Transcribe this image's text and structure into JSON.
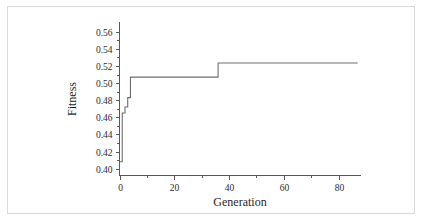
{
  "figure": {
    "background_color": "#ffffff",
    "border_color": "#d9d9d9",
    "axis_color": "#59595b",
    "line_color": "#6e6e70"
  },
  "chart_data": {
    "type": "line",
    "title": "",
    "xlabel": "Generation",
    "ylabel": "Fitness",
    "xlim": [
      0,
      88
    ],
    "ylim": [
      0.392,
      0.572
    ],
    "grid": false,
    "legend": null,
    "x_ticks": [
      0,
      20,
      40,
      60,
      80
    ],
    "x_tick_labels": [
      "0",
      "20",
      "40",
      "60",
      "80"
    ],
    "x_minor_ticks": [
      10,
      30,
      50,
      70
    ],
    "y_ticks": [
      0.4,
      0.42,
      0.44,
      0.46,
      0.48,
      0.5,
      0.52,
      0.54,
      0.56
    ],
    "y_tick_labels": [
      "0.40",
      "0.42",
      "0.44",
      "0.46",
      "0.48",
      "0.50",
      "0.52",
      "0.54",
      "0.56"
    ],
    "y_minor_ticks": [
      0.41,
      0.43,
      0.45,
      0.47,
      0.49,
      0.51,
      0.53,
      0.55
    ],
    "series": [
      {
        "name": "Best fitness",
        "step": "post",
        "x": [
          0,
          1,
          1,
          2,
          2,
          3,
          3,
          4,
          4,
          36,
          36,
          87
        ],
        "y": [
          0.408,
          0.408,
          0.465,
          0.465,
          0.472,
          0.472,
          0.483,
          0.483,
          0.507,
          0.507,
          0.5235,
          0.5235
        ],
        "points": [
          {
            "generation": 0,
            "fitness": 0.408
          },
          {
            "generation": 1,
            "fitness": 0.465
          },
          {
            "generation": 2,
            "fitness": 0.472
          },
          {
            "generation": 3,
            "fitness": 0.483
          },
          {
            "generation": 4,
            "fitness": 0.507
          },
          {
            "generation": 36,
            "fitness": 0.5235
          },
          {
            "generation": 87,
            "fitness": 0.5235
          }
        ]
      }
    ]
  }
}
